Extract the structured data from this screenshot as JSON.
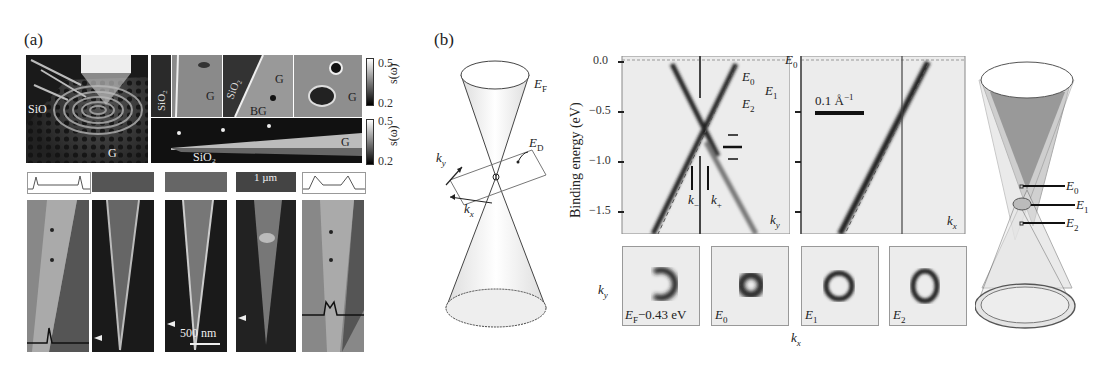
{
  "figure": {
    "panel_a": {
      "label": "(a)",
      "top_left_image": {
        "labels": [
          "SiO",
          "G"
        ]
      },
      "top_small_images": [
        {
          "labels": [
            "SiO2",
            "G"
          ]
        },
        {
          "labels": [
            "SiO2",
            "G",
            "BG"
          ]
        },
        {
          "labels": [
            "G"
          ]
        }
      ],
      "strip_image": {
        "labels": [
          "SiO2",
          "G"
        ]
      },
      "colorbars": [
        {
          "max": "0.5",
          "min": "0.2",
          "axis_label": "s(ω)"
        },
        {
          "max": "0.5",
          "min": "0.2",
          "axis_label": "s(ω)"
        }
      ],
      "scale_bars": {
        "top": "1 µm",
        "bottom": "500 nm"
      }
    },
    "panel_b": {
      "label": "(b)",
      "cone_left": {
        "ef": "E",
        "ef_sub": "F",
        "ed": "E",
        "ed_sub": "D",
        "ky": "k",
        "ky_sub": "y",
        "kx": "k",
        "kx_sub": "x"
      },
      "arpes": {
        "y_axis_label": "Binding energy (eV)",
        "y_ticks": [
          "0.0",
          "−0.5",
          "−1.0",
          "−1.5"
        ],
        "e0_top": "E",
        "e0_top_sub": "0",
        "levels": [
          {
            "name": "E",
            "sub": "0"
          },
          {
            "name": "E",
            "sub": "1"
          },
          {
            "name": "E",
            "sub": "2"
          }
        ],
        "k_minus": "k",
        "k_minus_sub": "−",
        "k_plus": "k",
        "k_plus_sub": "+",
        "left_axis": "k",
        "left_axis_sub": "y",
        "right_axis": "k",
        "right_axis_sub": "x",
        "scale": "0.1 Å",
        "scale_sup": "−1"
      },
      "constant_energy_maps": {
        "ylabel": "k",
        "ylabel_sub": "y",
        "xlabel": "k",
        "xlabel_sub": "x",
        "maps": [
          {
            "label": "E",
            "sub": "F",
            "suffix": "−0.43 eV"
          },
          {
            "label": "E",
            "sub": "0",
            "suffix": ""
          },
          {
            "label": "E",
            "sub": "1",
            "suffix": ""
          },
          {
            "label": "E",
            "sub": "2",
            "suffix": ""
          }
        ]
      },
      "cone_right": {
        "levels": [
          {
            "name": "E",
            "sub": "0"
          },
          {
            "name": "E",
            "sub": "1"
          },
          {
            "name": "E",
            "sub": "2"
          }
        ]
      }
    }
  }
}
